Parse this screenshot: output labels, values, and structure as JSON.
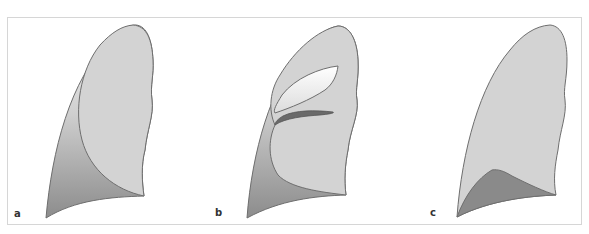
{
  "figure": {
    "panels": [
      {
        "id": "a",
        "label": "a",
        "description": "Lung with pleural effusion separating lung from chest wall, lamellar layering along lateral wall"
      },
      {
        "id": "b",
        "label": "b",
        "description": "Lung with interlobar fluid collections in fissures"
      },
      {
        "id": "c",
        "label": "c",
        "description": "Lung with subpulmonic / basal effusion shown as dark wedge at base"
      }
    ],
    "colors": {
      "lung_fill": "#d3d3d3",
      "outline": "#6e6e6e",
      "effusion_dark": "#8a8a8a",
      "effusion_light": "#f2f2f2",
      "frame_border": "#d6d6d6"
    }
  }
}
